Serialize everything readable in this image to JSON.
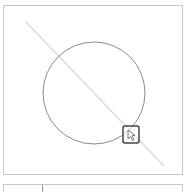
{
  "canvas": {
    "shapes": [
      {
        "type": "circle",
        "cx": 93,
        "cy": 92,
        "r": 49,
        "stroke": "#8a8a8a"
      },
      {
        "type": "line",
        "x1": 24,
        "y1": 20,
        "x2": 163,
        "y2": 165,
        "stroke": "#dcdcdc"
      }
    ],
    "handle": {
      "x": 122,
      "y": 125,
      "size": 16,
      "icon": "pointer-icon"
    }
  },
  "bottom_bar": {}
}
